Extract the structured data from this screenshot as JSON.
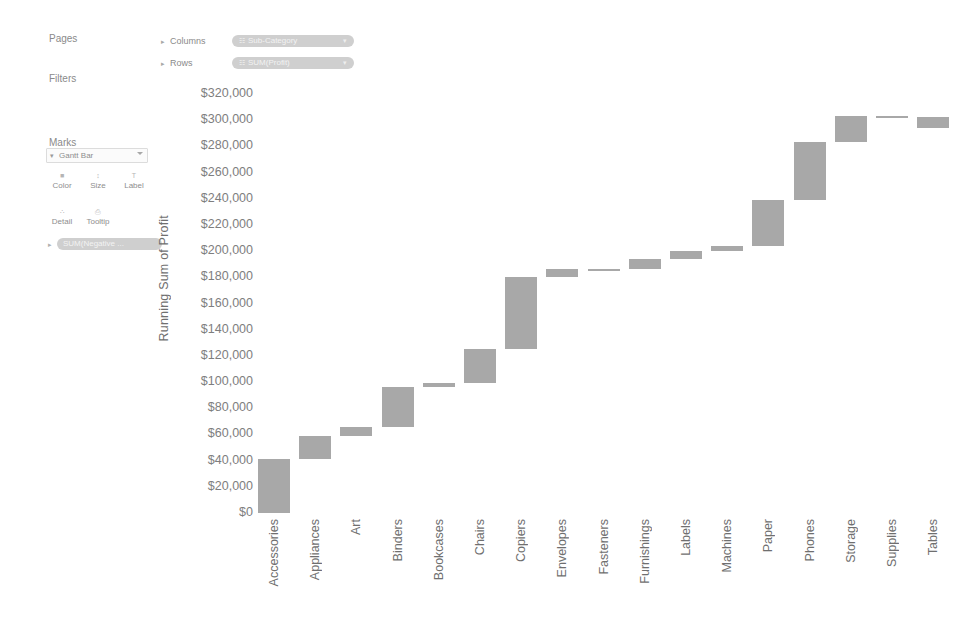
{
  "sidebar": {
    "pages_label": "Pages",
    "filters_label": "Filters",
    "marks_label": "Marks",
    "mark_type": "Gantt Bar",
    "mark_type_icon": "gantt-bar-icon",
    "caret_icon": "▾",
    "buttons": [
      {
        "name": "color",
        "label": "Color",
        "icon": "■"
      },
      {
        "name": "size",
        "label": "Size",
        "icon": "↕"
      },
      {
        "name": "label",
        "label": "Label",
        "icon": "T"
      },
      {
        "name": "detail",
        "label": "Detail",
        "icon": "∴"
      },
      {
        "name": "tooltip",
        "label": "Tooltip",
        "icon": "⎙"
      }
    ],
    "marks_pill": "SUM(Negative ...",
    "marks_pill_icon": "▸"
  },
  "shelves": {
    "columns_label": "Columns",
    "rows_label": "Rows",
    "expand_icon": "▸",
    "columns_pill": "Sub-Category",
    "columns_pill_icon": "☷",
    "rows_pill": "SUM(Profit)",
    "rows_pill_icon": "☷",
    "pill_close_icon": "▾"
  },
  "chart_data": {
    "type": "bar",
    "chart_style": "waterfall",
    "title": "",
    "xlabel": "",
    "ylabel": "Running Sum of Profit",
    "ylim": [
      0,
      320000
    ],
    "ytick_step": 20000,
    "grid": false,
    "legend": "none",
    "bar_color": "#a8a8a8",
    "ytick_labels": [
      "$320,000",
      "$300,000",
      "$280,000",
      "$260,000",
      "$240,000",
      "$220,000",
      "$200,000",
      "$180,000",
      "$160,000",
      "$140,000",
      "$120,000",
      "$100,000",
      "$80,000",
      "$60,000",
      "$40,000",
      "$20,000",
      "$0"
    ],
    "categories": [
      "Accessories",
      "Appliances",
      "Art",
      "Binders",
      "Bookcases",
      "Chairs",
      "Copiers",
      "Envelopes",
      "Fasteners",
      "Furnishings",
      "Labels",
      "Machines",
      "Paper",
      "Phones",
      "Storage",
      "Supplies",
      "Tables"
    ],
    "series": [
      {
        "name": "Profit (segment)",
        "values": [
          41000,
          18000,
          7000,
          30000,
          3000,
          26000,
          55000,
          6000,
          500,
          7500,
          6000,
          4000,
          35000,
          44000,
          20000,
          -500,
          -8500
        ]
      },
      {
        "name": "Running Sum of Profit (cumulative top)",
        "values": [
          41000,
          59000,
          66000,
          96000,
          99000,
          125000,
          180000,
          186000,
          186500,
          194000,
          200000,
          204000,
          239000,
          283000,
          303000,
          302500,
          294000
        ]
      }
    ],
    "bars": [
      {
        "category": "Accessories",
        "start": 0,
        "end": 41000
      },
      {
        "category": "Appliances",
        "start": 41000,
        "end": 59000
      },
      {
        "category": "Art",
        "start": 59000,
        "end": 66000
      },
      {
        "category": "Binders",
        "start": 66000,
        "end": 96000
      },
      {
        "category": "Bookcases",
        "start": 96000,
        "end": 99000
      },
      {
        "category": "Chairs",
        "start": 99000,
        "end": 125000
      },
      {
        "category": "Copiers",
        "start": 125000,
        "end": 180000
      },
      {
        "category": "Envelopes",
        "start": 180000,
        "end": 186000
      },
      {
        "category": "Fasteners",
        "start": 186000,
        "end": 186500
      },
      {
        "category": "Furnishings",
        "start": 186500,
        "end": 194000
      },
      {
        "category": "Labels",
        "start": 194000,
        "end": 200000
      },
      {
        "category": "Machines",
        "start": 200000,
        "end": 204000
      },
      {
        "category": "Paper",
        "start": 204000,
        "end": 239000
      },
      {
        "category": "Phones",
        "start": 239000,
        "end": 283000
      },
      {
        "category": "Storage",
        "start": 283000,
        "end": 303000
      },
      {
        "category": "Supplies",
        "start": 302500,
        "end": 303000
      },
      {
        "category": "Tables",
        "start": 294000,
        "end": 302500
      }
    ]
  }
}
